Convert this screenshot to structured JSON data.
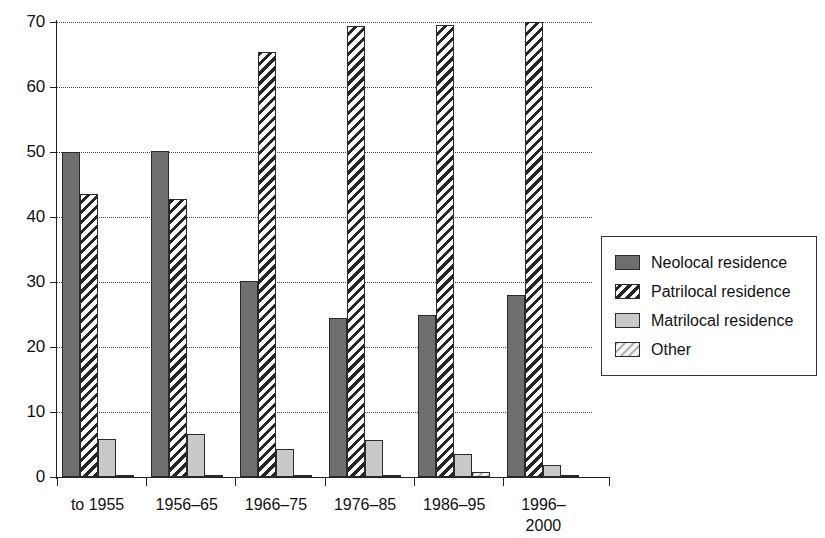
{
  "chart_data": {
    "type": "bar",
    "title": "",
    "subtitle": "",
    "xlabel": "",
    "ylabel": "",
    "ylim": [
      0,
      70
    ],
    "yticks": [
      0,
      10,
      20,
      30,
      40,
      50,
      60,
      70
    ],
    "grid": true,
    "legend_position": "right",
    "categories": [
      "to 1955",
      "1956–65",
      "1966–75",
      "1976–85",
      "1986–95",
      "1996–2000"
    ],
    "category_lines": [
      [
        "to 1955"
      ],
      [
        "1956–65"
      ],
      [
        "1966–75"
      ],
      [
        "1976–85"
      ],
      [
        "1986–95"
      ],
      [
        "1996–",
        "2000"
      ]
    ],
    "series": [
      {
        "name": "Neolocal residence",
        "key": "neolocal",
        "fill": "solid-dark-gray",
        "color": "#6e6e6e",
        "values": [
          50.0,
          50.2,
          30.2,
          24.5,
          24.9,
          28.0
        ]
      },
      {
        "name": "Patrilocal residence",
        "key": "patrilocal",
        "fill": "diagonal-hatch-dark",
        "color": "#ffffff",
        "values": [
          43.5,
          42.8,
          65.4,
          69.4,
          69.5,
          70.0
        ]
      },
      {
        "name": "Matrilocal residence",
        "key": "matrilocal",
        "fill": "solid-light-gray",
        "color": "#c9c9c9",
        "values": [
          5.8,
          6.6,
          4.3,
          5.7,
          3.6,
          1.8
        ]
      },
      {
        "name": "Other",
        "key": "other",
        "fill": "diagonal-hatch-light",
        "color": "#e2e2e2",
        "values": [
          0.3,
          0.3,
          0.3,
          0.3,
          0.7,
          0.2
        ]
      }
    ]
  }
}
